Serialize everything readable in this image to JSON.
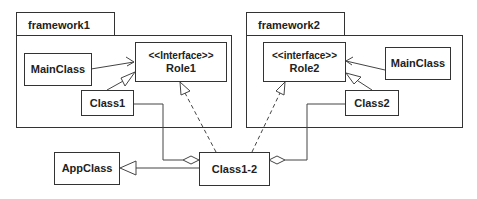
{
  "packages": [
    {
      "id": "framework1",
      "label": "framework1"
    },
    {
      "id": "framework2",
      "label": "framework2"
    }
  ],
  "classes": {
    "role1": {
      "stereotype": "<<Interface>>",
      "name": "Role1"
    },
    "role2": {
      "stereotype": "<<interface>>",
      "name": "Role2"
    },
    "mainclass1": {
      "name": "MainClass"
    },
    "mainclass2": {
      "name": "MainClass"
    },
    "class1": {
      "name": "Class1"
    },
    "class2": {
      "name": "Class2"
    },
    "appclass": {
      "name": "AppClass"
    },
    "class12": {
      "name": "Class1-2"
    }
  },
  "relations": [
    {
      "from": "MainClass (framework1)",
      "to": "Role1",
      "type": "dependency"
    },
    {
      "from": "Class1",
      "to": "Role1",
      "type": "generalization"
    },
    {
      "from": "MainClass (framework2)",
      "to": "Role2",
      "type": "dependency"
    },
    {
      "from": "Class2",
      "to": "Role2",
      "type": "generalization"
    },
    {
      "from": "Class1-2",
      "to": "Role1",
      "type": "realization"
    },
    {
      "from": "Class1-2",
      "to": "Role2",
      "type": "realization"
    },
    {
      "from": "Class1-2",
      "to": "Class1",
      "type": "aggregation"
    },
    {
      "from": "Class1-2",
      "to": "Class2",
      "type": "aggregation"
    },
    {
      "from": "Class1-2",
      "to": "AppClass",
      "type": "generalization"
    }
  ]
}
